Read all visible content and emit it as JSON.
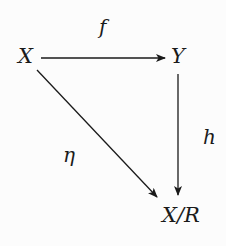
{
  "diagram": {
    "type": "commutative-diagram",
    "colors": {
      "background": "#fcfcfc",
      "ink": "#1a1a1a"
    },
    "nodes": {
      "x": {
        "label": "X"
      },
      "y": {
        "label": "Y"
      },
      "quotient": {
        "label": "X/R"
      }
    },
    "arrows": {
      "f": {
        "label": "f",
        "from": "X",
        "to": "Y"
      },
      "h": {
        "label": "h",
        "from": "Y",
        "to": "X/R"
      },
      "eta": {
        "label": "η",
        "from": "X",
        "to": "X/R"
      }
    }
  }
}
